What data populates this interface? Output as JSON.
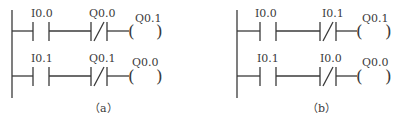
{
  "diagrams": [
    {
      "id": "a",
      "caption": "（a）",
      "rungs": [
        {
          "no_contact": {
            "label": "I0.0"
          },
          "nc_contact": {
            "label": "Q0.0"
          },
          "coil": {
            "label": "Q0.1",
            "open": "(",
            "close": ")"
          }
        },
        {
          "no_contact": {
            "label": "I0.1"
          },
          "nc_contact": {
            "label": "Q0.1"
          },
          "coil": {
            "label": "Q0.0",
            "open": "(",
            "close": ")"
          }
        }
      ]
    },
    {
      "id": "b",
      "caption": "（b）",
      "rungs": [
        {
          "no_contact": {
            "label": "I0.0"
          },
          "nc_contact": {
            "label": "I0.1"
          },
          "coil": {
            "label": "Q0.1",
            "open": "(",
            "close": ")"
          }
        },
        {
          "no_contact": {
            "label": "I0.1"
          },
          "nc_contact": {
            "label": "I0.0"
          },
          "coil": {
            "label": "Q0.0",
            "open": "(",
            "close": ")"
          }
        }
      ]
    }
  ],
  "colors": {
    "line": "#3a3a3a",
    "background": "#ffffff"
  }
}
